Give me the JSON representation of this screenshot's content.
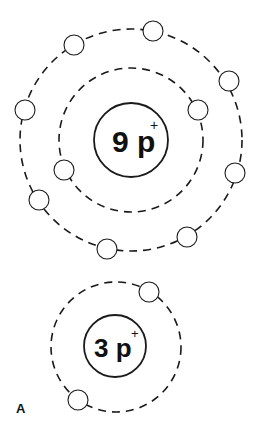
{
  "diagram": {
    "type": "bohr-atom-models",
    "panel_label": "A",
    "atoms": [
      {
        "id": "fluorine",
        "nucleus_label": "9 p",
        "nucleus_charge": "+",
        "center": [
          131,
          140
        ],
        "nucleus_radius": 37,
        "shells": [
          {
            "radius": 72,
            "electrons": 2
          },
          {
            "radius": 111,
            "electrons": 7
          }
        ],
        "electron_positions": [
          [
            153,
            31
          ],
          [
            74,
            45
          ],
          [
            229,
            81
          ],
          [
            198,
            110
          ],
          [
            25,
            110
          ],
          [
            64,
            170
          ],
          [
            235,
            173
          ],
          [
            39,
            200
          ],
          [
            187,
            237
          ],
          [
            107,
            249
          ]
        ]
      },
      {
        "id": "lithium",
        "nucleus_label": "3 p",
        "nucleus_charge": "+",
        "center": [
          116,
          346
        ],
        "nucleus_radius": 31,
        "shells": [
          {
            "radius": 65,
            "electrons": 2
          }
        ],
        "electron_positions": [
          [
            149,
            292
          ],
          [
            78,
            400
          ]
        ]
      }
    ]
  }
}
